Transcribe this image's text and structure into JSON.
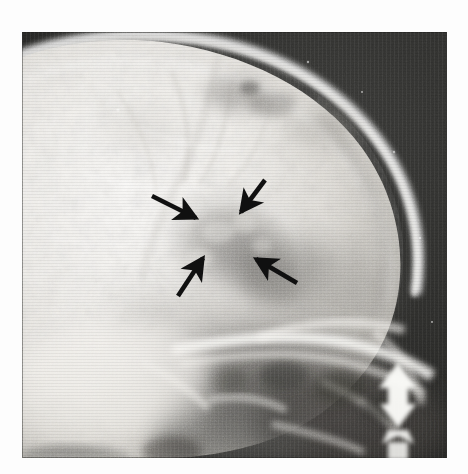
{
  "figure": {
    "kind": "radiograph",
    "modality": "plain-film-xray",
    "view": "lateral-skull",
    "background_color": "#ffffff",
    "film_background_color": "#2b2b2b",
    "bone_bright_color": "#f2f1ee",
    "soft_tissue_color": "#b4b2ae",
    "lesion_color": "#8e8c89",
    "annotation_color": "#101010",
    "marker_color": "#fbfbf8"
  },
  "plate": {
    "x": 22,
    "y": 32,
    "width": 425,
    "height": 426
  },
  "annotations": {
    "arrow_count": 4,
    "arrows": [
      {
        "name": "arrow-left-pointing-right-down",
        "tail_x": 152,
        "tail_y": 196,
        "tip_x": 196,
        "tip_y": 218,
        "direction": "down-right",
        "points_at": "lesion-margin-anterior"
      },
      {
        "name": "arrow-top-right-pointing-down-left",
        "tail_x": 265,
        "tail_y": 180,
        "tip_x": 241,
        "tip_y": 212,
        "direction": "down-left",
        "points_at": "lesion-margin-superior"
      },
      {
        "name": "arrow-right-pointing-up-left",
        "tail_x": 297,
        "tail_y": 283,
        "tip_x": 256,
        "tip_y": 259,
        "direction": "up-left",
        "points_at": "lesion-margin-posterior"
      },
      {
        "name": "arrow-bottom-pointing-up-right",
        "tail_x": 178,
        "tail_y": 296,
        "tip_x": 203,
        "tip_y": 258,
        "direction": "up-right",
        "points_at": "lesion-margin-inferior"
      }
    ],
    "side_marker": {
      "name": "white-arrow-marker",
      "shape": "upward-arrow",
      "x": 378,
      "y": 386,
      "width": 42,
      "height": 72,
      "color": "#fbfbf8"
    }
  },
  "regions": [
    {
      "name": "calvarium-vault",
      "label": "Calvarial vault"
    },
    {
      "name": "outer-table-line",
      "label": "Outer table"
    },
    {
      "name": "lucent-lesion",
      "label": "Lucent lesion"
    },
    {
      "name": "skull-base",
      "label": "Skull base"
    },
    {
      "name": "petrous-ridge",
      "label": "Petrous ridge"
    },
    {
      "name": "occipital-region",
      "label": "Occiput"
    },
    {
      "name": "film-background",
      "label": "Film background"
    }
  ]
}
